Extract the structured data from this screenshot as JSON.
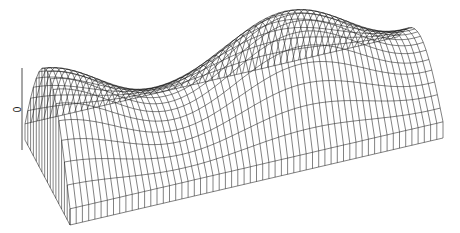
{
  "chart_data": {
    "type": "surface-wireframe",
    "title": "",
    "xlabel": "",
    "ylabel": "",
    "zlabel": "0",
    "z_axis_tick": "0",
    "grid": false,
    "legend": null,
    "mesh": {
      "nx": 60,
      "ny": 16
    },
    "surface": {
      "formula": "z = cos(pi*y/2) * (0.55 + 0.45*cos(2*pi*x*1.5))",
      "x_range": [
        0,
        1
      ],
      "y_range": [
        -1,
        1
      ]
    },
    "line_color": "#1a1a1a",
    "background": "#ffffff"
  }
}
